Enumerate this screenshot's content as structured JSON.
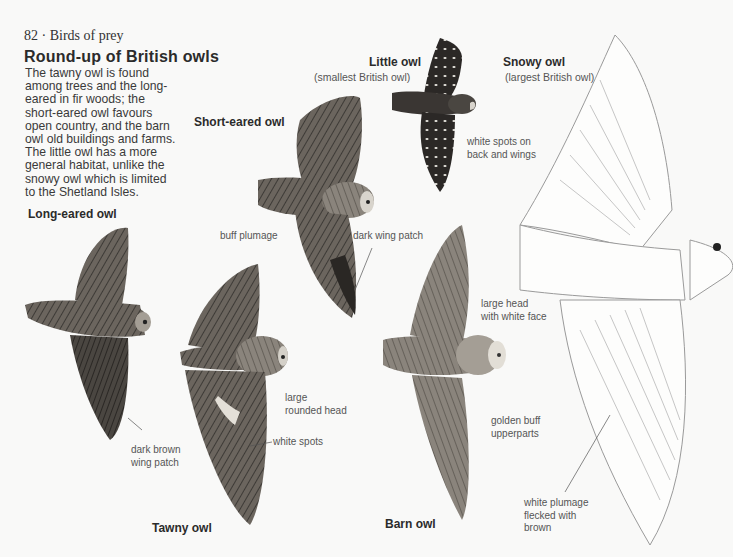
{
  "page": {
    "running_head": "82 · Birds of prey",
    "title": "Round-up of British owls",
    "intro_lines": [
      "The tawny owl is found",
      "among trees and the long-",
      "eared in fir woods; the",
      "short-eared owl favours",
      "open country, and the barn",
      "owl old buildings and farms.",
      "The little owl has a more",
      "general habitat, unlike the",
      "snowy owl which is limited",
      "to the Shetland Isles."
    ]
  },
  "owls": {
    "long_eared": {
      "name": "Long-eared owl",
      "note": [
        "dark brown",
        "wing patch"
      ]
    },
    "short_eared": {
      "name": "Short-eared owl",
      "notes": {
        "plumage": "buff plumage",
        "wing": "dark wing patch"
      }
    },
    "little": {
      "name": "Little owl",
      "subtitle": "(smallest British owl)",
      "note": [
        "white spots on",
        "back and wings"
      ]
    },
    "snowy": {
      "name": "Snowy owl",
      "subtitle": "(largest British owl)",
      "note": [
        "white plumage",
        "flecked with",
        "brown"
      ]
    },
    "tawny": {
      "name": "Tawny owl",
      "notes": {
        "head": [
          "large",
          "rounded head"
        ],
        "spots": "white spots"
      }
    },
    "barn": {
      "name": "Barn owl",
      "notes": {
        "head": [
          "large head",
          "with white face"
        ],
        "upper": [
          "golden buff",
          "upperparts"
        ]
      }
    }
  },
  "colors": {
    "paper": "#f9f9f8",
    "ink": "#2b2b2b",
    "plumage_dark": "#3d3a36",
    "plumage_mid": "#6b655e",
    "plumage_light": "#9c958c",
    "snowy_line": "#9a9a9a"
  }
}
